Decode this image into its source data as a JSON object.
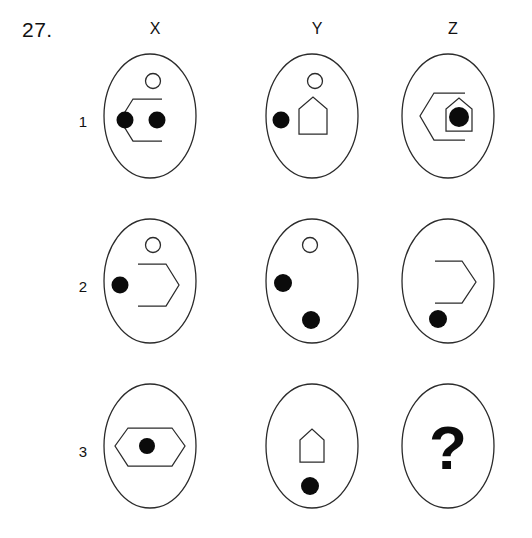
{
  "puzzle": {
    "number": "27.",
    "type": "visual-analogy-matrix",
    "columns": [
      "X",
      "Y",
      "Z"
    ],
    "rows": [
      "1",
      "2",
      "3"
    ],
    "answer_placeholder": "?",
    "colors": {
      "stroke": "#2b2b2b",
      "fill_dot": "#0b0b0b",
      "background": "#ffffff",
      "text": "#111111"
    },
    "cells": [
      {
        "id": "x1",
        "row": "1",
        "column": "X",
        "description": "ellipse containing small open circle at top, left-open hexagon outline, two filled dots",
        "elements": [
          "open-circle",
          "hexagon-left-half",
          "filled-dot",
          "filled-dot"
        ]
      },
      {
        "id": "y1",
        "row": "1",
        "column": "Y",
        "description": "ellipse containing small open circle at top, house pentagon outline, one filled dot at left",
        "elements": [
          "open-circle",
          "house-pentagon",
          "filled-dot"
        ]
      },
      {
        "id": "z1",
        "row": "1",
        "column": "Z",
        "description": "ellipse containing left-open hexagon overlapping house pentagon with filled dot inside house",
        "elements": [
          "hexagon-left-half",
          "house-pentagon",
          "filled-dot"
        ]
      },
      {
        "id": "x2",
        "row": "2",
        "column": "X",
        "description": "ellipse containing small open circle at top, right-open hexagon outline, one filled dot at left",
        "elements": [
          "open-circle",
          "hexagon-right-half",
          "filled-dot"
        ]
      },
      {
        "id": "y2",
        "row": "2",
        "column": "Y",
        "description": "ellipse containing small open circle at top, two filled dots (upper left and lower center)",
        "elements": [
          "open-circle",
          "filled-dot",
          "filled-dot"
        ]
      },
      {
        "id": "z2",
        "row": "2",
        "column": "Z",
        "description": "ellipse containing right-open hexagon outline and one filled dot at lower left",
        "elements": [
          "hexagon-right-half",
          "filled-dot"
        ]
      },
      {
        "id": "x3",
        "row": "3",
        "column": "X",
        "description": "ellipse containing closed wide hexagon with filled dot at center",
        "elements": [
          "hexagon-closed",
          "filled-dot"
        ]
      },
      {
        "id": "y3",
        "row": "3",
        "column": "Y",
        "description": "ellipse containing house pentagon and one filled dot below it",
        "elements": [
          "house-pentagon",
          "filled-dot"
        ]
      },
      {
        "id": "z3",
        "row": "3",
        "column": "Z",
        "description": "empty ellipse containing a large question mark",
        "elements": [
          "question-mark"
        ]
      }
    ]
  }
}
